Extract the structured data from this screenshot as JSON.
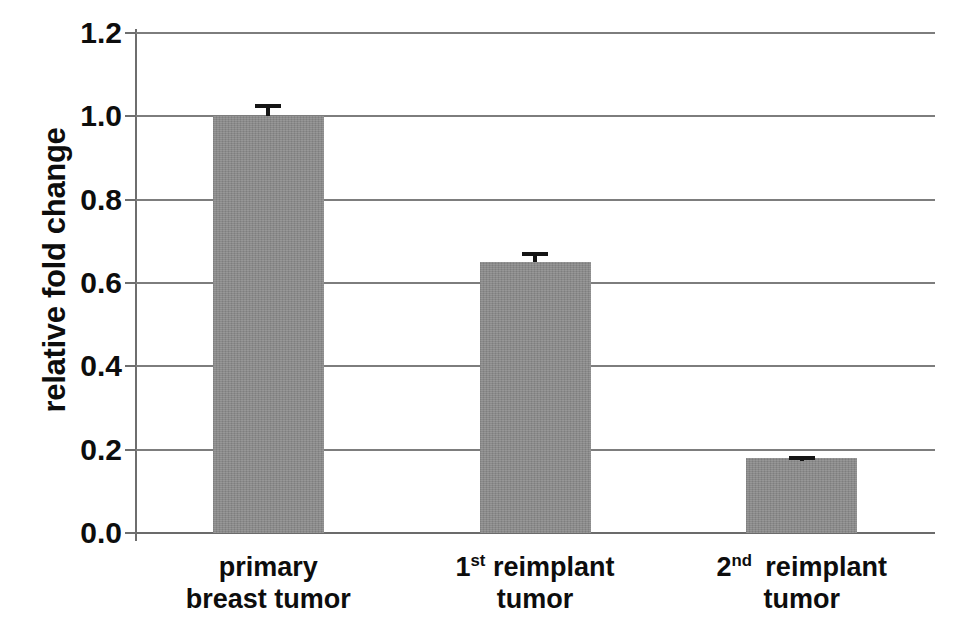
{
  "chart_data": {
    "type": "bar",
    "title": "",
    "xlabel": "",
    "ylabel": "relative fold change",
    "categories": [
      "primary breast tumor",
      "1st reimplant tumor",
      "2nd reimplant tumor"
    ],
    "category_lines": [
      [
        "primary",
        "breast tumor"
      ],
      [
        "1st reimplant",
        "tumor"
      ],
      [
        "2nd  reimplant",
        "tumor"
      ]
    ],
    "values": [
      1.0,
      0.65,
      0.18
    ],
    "errors": [
      0.03,
      0.025,
      0.005
    ],
    "ylim": [
      0.0,
      1.2
    ],
    "yticks": [
      "0.0",
      "0.2",
      "0.4",
      "0.6",
      "0.8",
      "1.0",
      "1.2"
    ],
    "ytick_values": [
      0.0,
      0.2,
      0.4,
      0.6,
      0.8,
      1.0,
      1.2
    ],
    "grid": "horizontal",
    "legend": "none",
    "bar_color": "#8b8b8b",
    "error_color": "#151515",
    "grid_color": "#7d7d7d",
    "axis_color": "#6e6e6e",
    "text_color": "#0d0d0d",
    "background": "#ffffff"
  }
}
